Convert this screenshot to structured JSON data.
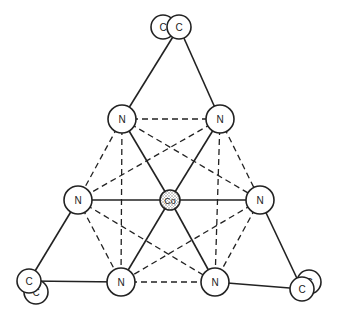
{
  "diagram": {
    "type": "molecular-structure",
    "colors": {
      "line": "#222222",
      "atom_fill": "#ffffff",
      "center_fill": "#d9d9d9"
    },
    "center": {
      "id": "Co",
      "label": "Co",
      "x": 170,
      "y": 200,
      "r": 10
    },
    "nitrogens": [
      {
        "id": "N1",
        "label": "N",
        "x": 122,
        "y": 119,
        "r": 14
      },
      {
        "id": "N2",
        "label": "N",
        "x": 220,
        "y": 119,
        "r": 14
      },
      {
        "id": "N3",
        "label": "N",
        "x": 78,
        "y": 200,
        "r": 14
      },
      {
        "id": "N4",
        "label": "N",
        "x": 260,
        "y": 200,
        "r": 14
      },
      {
        "id": "N5",
        "label": "N",
        "x": 121,
        "y": 282,
        "r": 14
      },
      {
        "id": "N6",
        "label": "N",
        "x": 215,
        "y": 282,
        "r": 14
      }
    ],
    "carbons": [
      {
        "id": "C1b",
        "label": "C",
        "x": 163,
        "y": 27,
        "r": 12
      },
      {
        "id": "C1",
        "label": "C",
        "x": 179,
        "y": 27,
        "r": 12
      },
      {
        "id": "C2b",
        "label": "C",
        "x": 36,
        "y": 292,
        "r": 12
      },
      {
        "id": "C2",
        "label": "C",
        "x": 29,
        "y": 281,
        "r": 12
      },
      {
        "id": "C3b",
        "label": "C",
        "x": 309,
        "y": 282,
        "r": 12
      },
      {
        "id": "C3",
        "label": "C",
        "x": 302,
        "y": 289,
        "r": 12
      }
    ],
    "solid_bonds": [
      [
        "Co",
        "N1"
      ],
      [
        "Co",
        "N2"
      ],
      [
        "Co",
        "N3"
      ],
      [
        "Co",
        "N4"
      ],
      [
        "Co",
        "N5"
      ],
      [
        "Co",
        "N6"
      ],
      [
        "N1",
        "C1"
      ],
      [
        "N2",
        "C1"
      ],
      [
        "N3",
        "C2"
      ],
      [
        "N5",
        "C2"
      ],
      [
        "N4",
        "C3"
      ],
      [
        "N6",
        "C3"
      ]
    ],
    "dashed_edges": [
      [
        "N1",
        "N2"
      ],
      [
        "N1",
        "N3"
      ],
      [
        "N1",
        "N4"
      ],
      [
        "N1",
        "N5"
      ],
      [
        "N2",
        "N4"
      ],
      [
        "N2",
        "N3"
      ],
      [
        "N2",
        "N6"
      ],
      [
        "N3",
        "N5"
      ],
      [
        "N3",
        "N6"
      ],
      [
        "N4",
        "N6"
      ],
      [
        "N4",
        "N5"
      ],
      [
        "N5",
        "N6"
      ]
    ]
  }
}
